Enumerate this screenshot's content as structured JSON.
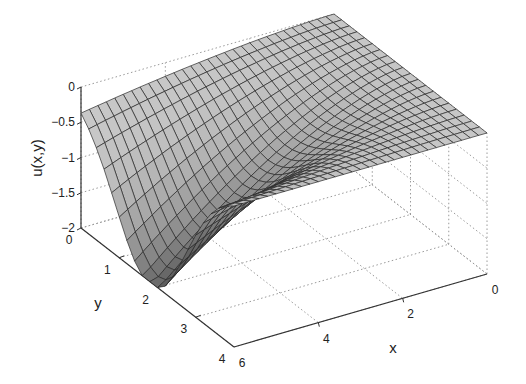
{
  "chart_data": {
    "type": "surface3d",
    "title": "",
    "xlabel": "x",
    "ylabel": "y",
    "zlabel": "u(x,y)",
    "xlim": [
      0,
      6
    ],
    "ylim": [
      0,
      4
    ],
    "zlim": [
      -2,
      0
    ],
    "x_ticks": [
      {
        "value": 0,
        "label": "0"
      },
      {
        "value": 2,
        "label": "2"
      },
      {
        "value": 4,
        "label": "4"
      },
      {
        "value": 6,
        "label": "6"
      }
    ],
    "y_ticks": [
      {
        "value": 0,
        "label": "0"
      },
      {
        "value": 1,
        "label": "1"
      },
      {
        "value": 2,
        "label": "2"
      },
      {
        "value": 3,
        "label": "3"
      },
      {
        "value": 4,
        "label": "4"
      }
    ],
    "z_ticks": [
      {
        "value": 0,
        "label": "0"
      },
      {
        "value": -0.5,
        "label": "-0.5"
      },
      {
        "value": -1,
        "label": "-1"
      },
      {
        "value": -1.5,
        "label": "-1.5"
      },
      {
        "value": -2,
        "label": "-2"
      }
    ],
    "grid": true,
    "grid_style": "dotted",
    "mesh": {
      "nx": 30,
      "ny": 20
    },
    "colors": {
      "surface_high": "#d2d2d2",
      "surface_low": "#5a5a5a",
      "mesh_line": "#2a2a2a",
      "axis": "#333333",
      "grid": "#9a9a9a"
    },
    "surface_description": "u is ~0 at x=0 and y=4 edge, decreasing to a minimum of about -2 near x=6, y~2 (bowl shape)",
    "sample_values": [
      {
        "x": 0,
        "y": 0,
        "u": 0
      },
      {
        "x": 0,
        "y": 4,
        "u": 0
      },
      {
        "x": 3,
        "y": 2,
        "u": -0.6
      },
      {
        "x": 6,
        "y": 0,
        "u": 0
      },
      {
        "x": 6,
        "y": 2,
        "u": -2.0
      },
      {
        "x": 6,
        "y": 4,
        "u": -0.1
      }
    ]
  }
}
